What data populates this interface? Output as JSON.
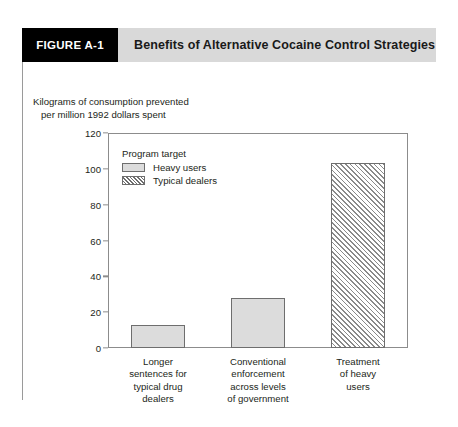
{
  "figure": {
    "number_label": "FIGURE A-1",
    "title": "Benefits of Alternative Cocaine Control Strategies"
  },
  "axis_caption": "Kilograms of consumption prevented\n   per million 1992 dollars spent",
  "legend": {
    "title": "Program target",
    "entries": [
      {
        "label": "Heavy users",
        "pattern": "solid"
      },
      {
        "label": "Typical dealers",
        "pattern": "hatched"
      }
    ]
  },
  "chart_data": {
    "type": "bar",
    "title": "Benefits of Alternative Cocaine Control Strategies",
    "xlabel": "",
    "ylabel": "Kilograms of consumption prevented per million 1992 dollars spent",
    "ylim": [
      0,
      120
    ],
    "yticks": [
      0,
      20,
      40,
      60,
      80,
      100,
      120
    ],
    "ytick_labels": [
      "0",
      "20",
      "40",
      "60",
      "80",
      "100",
      "120"
    ],
    "grid": false,
    "legend_position": "upper-left-inside",
    "categories": [
      "Longer\nsentences for\ntypical drug\ndealers",
      "Conventional\nenforcement\nacross levels\nof government",
      "Treatment\nof heavy\nusers"
    ],
    "values": [
      13,
      28,
      103
    ],
    "series": [
      {
        "name": "Typical dealers",
        "values": [
          13,
          28,
          null
        ],
        "pattern": "solid"
      },
      {
        "name": "Heavy users",
        "values": [
          null,
          null,
          103
        ],
        "pattern": "hatched"
      }
    ],
    "bar_patterns": [
      "solid",
      "solid",
      "hatched"
    ]
  },
  "colors": {
    "header_band": "#d9d9d9",
    "number_box": "#000000",
    "bar_fill": "#dcdcdc",
    "bar_stroke": "#6e6e6e",
    "axis": "#8c8c8c",
    "text": "#231f20"
  }
}
